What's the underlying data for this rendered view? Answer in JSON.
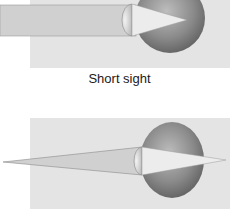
{
  "figure": {
    "top_diagram": {
      "caption": "Short sight",
      "condition": "short-sight",
      "description": "Parallel light rays focus in front of the retina"
    },
    "bottom_diagram": {
      "caption": "",
      "condition": "normal-vision",
      "description": "Diverging light rays from a near object focus on the retina"
    }
  },
  "colors": {
    "panel_background": "#e4e4e4",
    "light_beam": "#d2d2d2",
    "eyeball_dark": "#6e6e6e",
    "eyeball_light": "#bdbdbd",
    "focus_cone": "#ececec",
    "outline": "#8a8a8a"
  }
}
